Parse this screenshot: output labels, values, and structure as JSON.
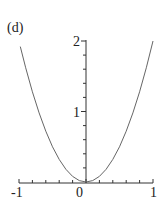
{
  "panel": {
    "label": "(d)"
  },
  "chart_data": {
    "type": "line",
    "title": "(d)",
    "xlabel": "",
    "ylabel": "",
    "xlim": [
      -1,
      1
    ],
    "ylim": [
      0,
      2
    ],
    "grid": false,
    "x_ticks": [
      "-1",
      "0",
      "1"
    ],
    "y_ticks": [
      "1",
      "2"
    ],
    "series": [
      {
        "name": "y = 2x^2",
        "color": "#666666",
        "x": [
          -0.98,
          -0.9,
          -0.8,
          -0.7,
          -0.6,
          -0.5,
          -0.4,
          -0.3,
          -0.2,
          -0.1,
          0,
          0.1,
          0.2,
          0.3,
          0.4,
          0.5,
          0.6,
          0.7,
          0.8,
          0.9,
          1.0
        ],
        "y": [
          1.92,
          1.62,
          1.28,
          0.98,
          0.72,
          0.5,
          0.32,
          0.18,
          0.08,
          0.02,
          0,
          0.02,
          0.08,
          0.18,
          0.32,
          0.5,
          0.72,
          0.98,
          1.28,
          1.62,
          2.0
        ]
      }
    ]
  }
}
